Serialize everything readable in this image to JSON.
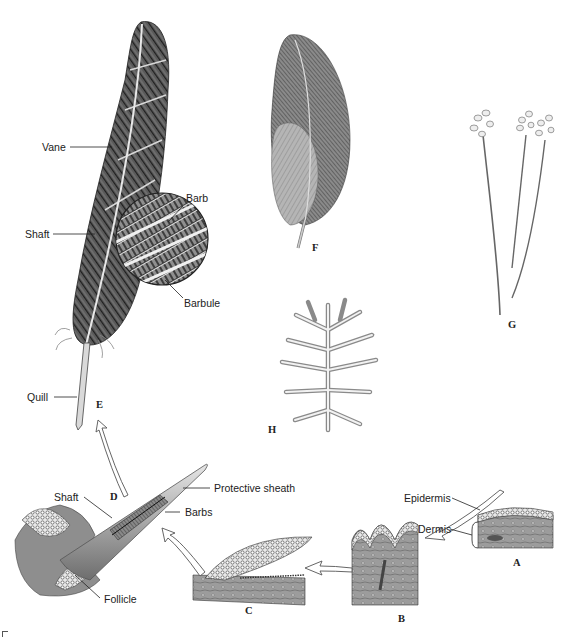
{
  "diagram": {
    "colors": {
      "ink": "#222222",
      "feather_dark": "#3a3a3a",
      "feather_mid": "#7a7a7a",
      "feather_light": "#bdbdbd",
      "tissue": "#9a9a9a",
      "background": "#ffffff"
    },
    "labels": {
      "vane": "Vane",
      "shaft_top": "Shaft",
      "barb": "Barb",
      "barbule": "Barbule",
      "quill": "Quill",
      "shaft_bottom": "Shaft",
      "protective_sheath": "Protective sheath",
      "barbs": "Barbs",
      "follicle": "Follicle",
      "epidermis": "Epidermis",
      "dermis": "Dermis"
    },
    "stages": {
      "A": "A",
      "B": "B",
      "C": "C",
      "D": "D",
      "E": "E",
      "F": "F",
      "G": "G",
      "H": "H"
    },
    "sequence": [
      "A",
      "B",
      "C",
      "D",
      "E"
    ],
    "figures": [
      {
        "id": "E",
        "description": "Contour feather with vane, shaft, quill and magnified barb/barbule inset"
      },
      {
        "id": "F",
        "description": "Contour feather with downy afterfeather"
      },
      {
        "id": "G",
        "description": "Three filoplumes"
      },
      {
        "id": "H",
        "description": "Down feather"
      },
      {
        "id": "D",
        "description": "Developing feather in protective sheath within follicle"
      },
      {
        "id": "C",
        "description": "Elongating feather bud"
      },
      {
        "id": "B",
        "description": "Epidermal fold / feather papilla forming"
      },
      {
        "id": "A",
        "description": "Skin section: epidermis over dermis"
      }
    ]
  }
}
